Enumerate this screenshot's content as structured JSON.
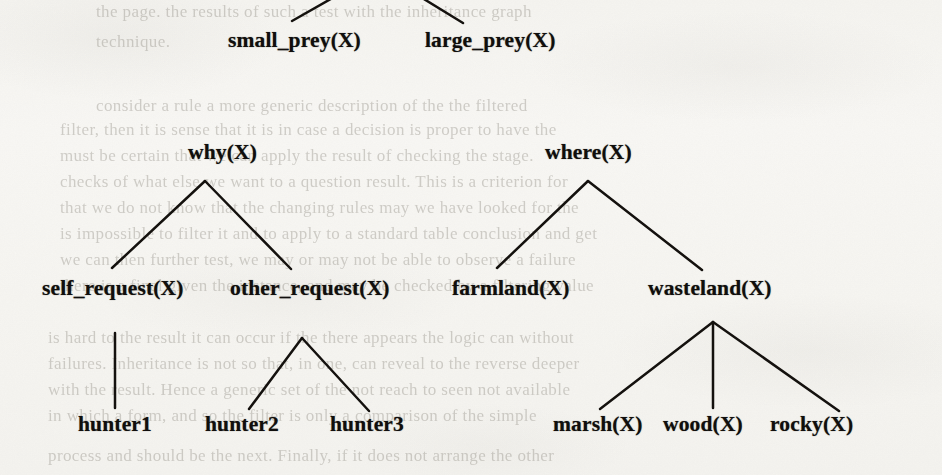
{
  "document": {
    "kind": "scanned-page-tree-diagram",
    "ink_color": "#100e0c",
    "paper_color": "#f7f6f3",
    "bleed_color": "#8e8a81"
  },
  "tree": {
    "rows": {
      "row1_label": "prey",
      "row2_label": "intermediate",
      "row3_label": "category",
      "row4_label": "leaf"
    },
    "nodes": [
      {
        "id": "small_prey",
        "text": "small_prey(X)",
        "x": 228,
        "y": 30,
        "row": 1
      },
      {
        "id": "large_prey",
        "text": "large_prey(X)",
        "x": 425,
        "y": 30,
        "row": 1
      },
      {
        "id": "why",
        "text": "why(X)",
        "x": 188,
        "y": 142,
        "row": 2
      },
      {
        "id": "where",
        "text": "where(X)",
        "x": 545,
        "y": 142,
        "row": 2
      },
      {
        "id": "self_request",
        "text": "self_request(X)",
        "x": 42,
        "y": 278,
        "row": 3
      },
      {
        "id": "other_request",
        "text": "other_request(X)",
        "x": 230,
        "y": 278,
        "row": 3
      },
      {
        "id": "farmland",
        "text": "farmland(X)",
        "x": 452,
        "y": 278,
        "row": 3
      },
      {
        "id": "wasteland",
        "text": "wasteland(X)",
        "x": 648,
        "y": 278,
        "row": 3
      },
      {
        "id": "hunter1",
        "text": "hunter1",
        "x": 78,
        "y": 414,
        "row": 4
      },
      {
        "id": "hunter2",
        "text": "hunter2",
        "x": 205,
        "y": 414,
        "row": 4
      },
      {
        "id": "hunter3",
        "text": "hunter3",
        "x": 330,
        "y": 414,
        "row": 4
      },
      {
        "id": "marsh",
        "text": "marsh(X)",
        "x": 553,
        "y": 414,
        "row": 4
      },
      {
        "id": "wood",
        "text": "wood(X)",
        "x": 663,
        "y": 414,
        "row": 4
      },
      {
        "id": "rocky",
        "text": "rocky(X)",
        "x": 770,
        "y": 414,
        "row": 4
      }
    ],
    "edges": [
      {
        "id": "edge-root-small_prey",
        "from": "root-above",
        "to": "small_prey",
        "x1": 336,
        "y1": -4,
        "x2": 292,
        "y2": 21
      },
      {
        "id": "edge-root-large_prey",
        "from": "root-above",
        "to": "large_prey",
        "x1": 419,
        "y1": -4,
        "x2": 463,
        "y2": 23
      },
      {
        "id": "edge-why-self",
        "from": "why",
        "to": "self_request",
        "x1": 205,
        "y1": 181,
        "x2": 112,
        "y2": 268
      },
      {
        "id": "edge-why-other",
        "from": "why",
        "to": "other_request",
        "x1": 205,
        "y1": 181,
        "x2": 291,
        "y2": 269
      },
      {
        "id": "edge-where-farmland",
        "from": "where",
        "to": "farmland",
        "x1": 588,
        "y1": 181,
        "x2": 497,
        "y2": 268
      },
      {
        "id": "edge-where-wasteland",
        "from": "where",
        "to": "wasteland",
        "x1": 588,
        "y1": 181,
        "x2": 702,
        "y2": 270
      },
      {
        "id": "edge-self-hunter1",
        "from": "self_request",
        "to": "hunter1",
        "x1": 115,
        "y1": 333,
        "x2": 115,
        "y2": 408
      },
      {
        "id": "edge-other-hunter2",
        "from": "other_request",
        "to": "hunter2",
        "x1": 302,
        "y1": 338,
        "x2": 249,
        "y2": 409
      },
      {
        "id": "edge-other-hunter3",
        "from": "other_request",
        "to": "hunter3",
        "x1": 302,
        "y1": 338,
        "x2": 369,
        "y2": 411
      },
      {
        "id": "edge-waste-marsh",
        "from": "wasteland",
        "to": "marsh",
        "x1": 713,
        "y1": 322,
        "x2": 600,
        "y2": 409
      },
      {
        "id": "edge-waste-wood",
        "from": "wasteland",
        "to": "wood",
        "x1": 713,
        "y1": 322,
        "x2": 713,
        "y2": 408
      },
      {
        "id": "edge-waste-rocky",
        "from": "wasteland",
        "to": "rocky",
        "x1": 713,
        "y1": 322,
        "x2": 839,
        "y2": 411
      }
    ]
  },
  "bleed_through": [
    {
      "text": "the page. the results of such a test with the inheritance graph",
      "x": 96,
      "y": 2,
      "size": 17
    },
    {
      "text": "technique.",
      "x": 96,
      "y": 32,
      "size": 17
    },
    {
      "text": "consider a rule a more generic description of the the filtered",
      "x": 96,
      "y": 96,
      "size": 17
    },
    {
      "text": "filter, then it is sense that it is in case a decision is proper to have the",
      "x": 60,
      "y": 120,
      "size": 17
    },
    {
      "text": "must be certain that we can apply the result of checking the stage.",
      "x": 60,
      "y": 146,
      "size": 17
    },
    {
      "text": "checks of what else we want to a question result.  This is a criterion for",
      "x": 60,
      "y": 172,
      "size": 17
    },
    {
      "text": "that we do not know that the changing rules may we have looked for the",
      "x": 60,
      "y": 198,
      "size": 17
    },
    {
      "text": "is impossible to filter it and to apply to a standard table conclusion and get",
      "x": 60,
      "y": 224,
      "size": 17
    },
    {
      "text": "we can then further test, we may or may not be able to observe a failure",
      "x": 60,
      "y": 250,
      "size": 17
    },
    {
      "text": "there is a final given the instance, and may be checked by a filtering value",
      "x": 60,
      "y": 276,
      "size": 17
    },
    {
      "text": "is hard to the result it can occur if the there appears the logic can without",
      "x": 48,
      "y": 328,
      "size": 17
    },
    {
      "text": "failures.  Inheritance is not so that, in one, can reveal to the reverse deeper",
      "x": 48,
      "y": 354,
      "size": 17
    },
    {
      "text": "with the result. Hence a generic set of the not reach to seen not available",
      "x": 48,
      "y": 380,
      "size": 17
    },
    {
      "text": "in which a form, and so the filter is only a comparison of the simple",
      "x": 48,
      "y": 406,
      "size": 17
    },
    {
      "text": "process and should be the next. Finally, if it does not arrange the other",
      "x": 48,
      "y": 446,
      "size": 17
    }
  ]
}
